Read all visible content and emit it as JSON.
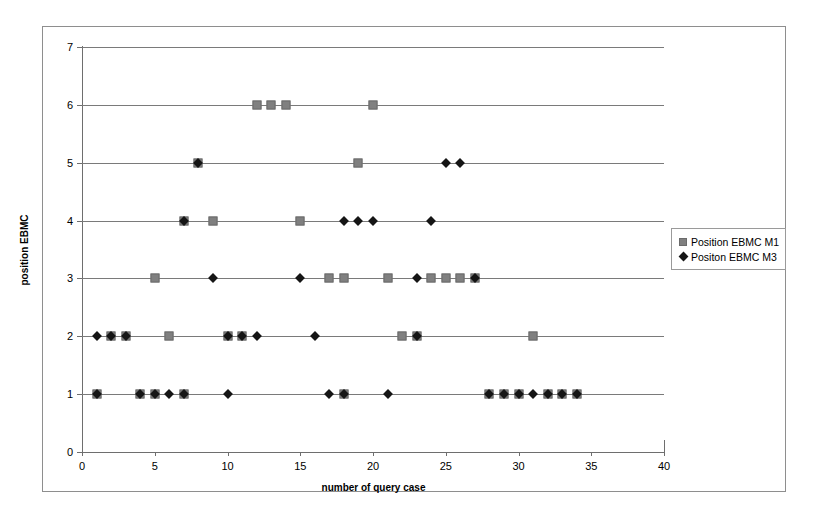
{
  "chart_data": {
    "type": "scatter",
    "title": "",
    "xlabel": "number of query case",
    "ylabel": "position EBMC",
    "xlim": [
      0,
      40
    ],
    "ylim": [
      0,
      7
    ],
    "xticks": [
      0,
      5,
      10,
      15,
      20,
      25,
      30,
      35,
      40
    ],
    "yticks": [
      0,
      1,
      2,
      3,
      4,
      5,
      6,
      7
    ],
    "grid": "horizontal",
    "legend_position": "right",
    "series": [
      {
        "name": "Position EBMC M1",
        "marker": "square",
        "color": "#808080",
        "points": [
          [
            1,
            1
          ],
          [
            2,
            2
          ],
          [
            3,
            2
          ],
          [
            5,
            3
          ],
          [
            6,
            2
          ],
          [
            7,
            4
          ],
          [
            8,
            5
          ],
          [
            9,
            4
          ],
          [
            10,
            2
          ],
          [
            11,
            2
          ],
          [
            12,
            6
          ],
          [
            13,
            6
          ],
          [
            14,
            6
          ],
          [
            15,
            4
          ],
          [
            17,
            3
          ],
          [
            18,
            3
          ],
          [
            18,
            1
          ],
          [
            20,
            6
          ],
          [
            19,
            5
          ],
          [
            21,
            3
          ],
          [
            22,
            2
          ],
          [
            23,
            2
          ],
          [
            24,
            3
          ],
          [
            25,
            3
          ],
          [
            26,
            3
          ],
          [
            27,
            3
          ],
          [
            28,
            1
          ],
          [
            29,
            1
          ],
          [
            30,
            1
          ],
          [
            31,
            2
          ],
          [
            32,
            1
          ],
          [
            33,
            1
          ],
          [
            34,
            1
          ],
          [
            7,
            1
          ],
          [
            5,
            1
          ],
          [
            4,
            1
          ]
        ]
      },
      {
        "name": "Positon EBMC M3",
        "marker": "diamond",
        "color": "#151515",
        "points": [
          [
            1,
            2
          ],
          [
            2,
            2
          ],
          [
            3,
            2
          ],
          [
            4,
            1
          ],
          [
            5,
            1
          ],
          [
            6,
            1
          ],
          [
            7,
            4
          ],
          [
            8,
            5
          ],
          [
            9,
            3
          ],
          [
            10,
            1
          ],
          [
            10,
            2
          ],
          [
            11,
            2
          ],
          [
            12,
            2
          ],
          [
            15,
            3
          ],
          [
            16,
            2
          ],
          [
            17,
            1
          ],
          [
            18,
            1
          ],
          [
            18,
            4
          ],
          [
            19,
            4
          ],
          [
            20,
            4
          ],
          [
            21,
            1
          ],
          [
            23,
            3
          ],
          [
            23,
            2
          ],
          [
            24,
            4
          ],
          [
            25,
            5
          ],
          [
            26,
            5
          ],
          [
            27,
            3
          ],
          [
            28,
            1
          ],
          [
            29,
            1
          ],
          [
            30,
            1
          ],
          [
            31,
            1
          ],
          [
            32,
            1
          ],
          [
            33,
            1
          ],
          [
            34,
            1
          ],
          [
            1,
            1
          ],
          [
            7,
            1
          ]
        ]
      }
    ]
  },
  "legend": {
    "items": [
      {
        "label": "Position EBMC M1",
        "marker": "square"
      },
      {
        "label": "Positon EBMC M3",
        "marker": "diamond"
      }
    ]
  },
  "axes": {
    "y_title": "position EBMC",
    "x_title": "number of query case",
    "y_tick_labels": [
      "0",
      "1",
      "2",
      "3",
      "4",
      "5",
      "6",
      "7"
    ],
    "x_tick_labels": [
      "0",
      "5",
      "10",
      "15",
      "20",
      "25",
      "30",
      "35",
      "40"
    ]
  }
}
